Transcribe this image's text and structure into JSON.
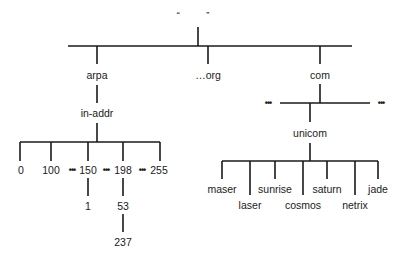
{
  "diagram": {
    "type": "dns-domain-name-tree",
    "root": {
      "label": "“ ”",
      "x": 199,
      "y": 15
    },
    "ellipsis_glyph": "•••",
    "nodes": [
      {
        "id": "arpa",
        "label": "arpa",
        "x": 97,
        "y": 75
      },
      {
        "id": "org",
        "label": "…org",
        "x": 208,
        "y": 75
      },
      {
        "id": "com",
        "label": "com",
        "x": 320,
        "y": 75
      },
      {
        "id": "in-addr",
        "label": "in-addr",
        "x": 97,
        "y": 113
      },
      {
        "id": "n0",
        "label": "0",
        "x": 21,
        "y": 170
      },
      {
        "id": "n100",
        "label": "100",
        "x": 51,
        "y": 170
      },
      {
        "id": "n150",
        "label": "150",
        "x": 88,
        "y": 170
      },
      {
        "id": "n198",
        "label": "198",
        "x": 123,
        "y": 170
      },
      {
        "id": "n255",
        "label": "255",
        "x": 159,
        "y": 170
      },
      {
        "id": "n1",
        "label": "1",
        "x": 88,
        "y": 206
      },
      {
        "id": "n53",
        "label": "53",
        "x": 123,
        "y": 206
      },
      {
        "id": "n237",
        "label": "237",
        "x": 123,
        "y": 242
      },
      {
        "id": "unicom",
        "label": "unicom",
        "x": 310,
        "y": 133
      },
      {
        "id": "maser",
        "label": "maser",
        "x": 222,
        "y": 189
      },
      {
        "id": "laser",
        "label": "laser",
        "x": 250,
        "y": 205
      },
      {
        "id": "sunrise",
        "label": "sunrise",
        "x": 275,
        "y": 189
      },
      {
        "id": "cosmos",
        "label": "cosmos",
        "x": 303,
        "y": 205
      },
      {
        "id": "saturn",
        "label": "saturn",
        "x": 327,
        "y": 189
      },
      {
        "id": "netrix",
        "label": "netrix",
        "x": 355,
        "y": 205
      },
      {
        "id": "jade",
        "label": "jade",
        "x": 378,
        "y": 189
      }
    ],
    "ellipses": [
      {
        "id": "dots-100-150",
        "x": 72,
        "y": 170
      },
      {
        "id": "dots-150-198",
        "x": 106,
        "y": 170
      },
      {
        "id": "dots-198-255",
        "x": 142,
        "y": 170
      },
      {
        "id": "dots-com-left",
        "x": 268,
        "y": 103
      },
      {
        "id": "dots-com-right",
        "x": 381,
        "y": 103
      }
    ],
    "edges": [
      [
        "root",
        "arpa"
      ],
      [
        "root",
        "org"
      ],
      [
        "root",
        "com"
      ],
      [
        "arpa",
        "in-addr"
      ],
      [
        "in-addr",
        "0"
      ],
      [
        "in-addr",
        "100"
      ],
      [
        "in-addr",
        "150"
      ],
      [
        "in-addr",
        "198"
      ],
      [
        "in-addr",
        "255"
      ],
      [
        "150",
        "1"
      ],
      [
        "198",
        "53"
      ],
      [
        "53",
        "237"
      ],
      [
        "com",
        "unicom"
      ],
      [
        "unicom",
        "maser"
      ],
      [
        "unicom",
        "laser"
      ],
      [
        "unicom",
        "sunrise"
      ],
      [
        "unicom",
        "cosmos"
      ],
      [
        "unicom",
        "saturn"
      ],
      [
        "unicom",
        "netrix"
      ],
      [
        "unicom",
        "jade"
      ]
    ]
  }
}
